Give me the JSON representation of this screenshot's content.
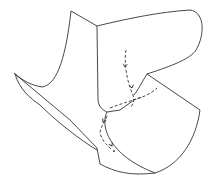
{
  "figure": {
    "type": "line-drawing",
    "stroke_color": "#333333",
    "background": "#ffffff",
    "surface_outline": [
      "M71,11 L97,26 C130,18 160,12 190,10 C205,12 205,35 196,50 C190,60 165,68 147,74 L200,110 C196,140 180,165 155,173 C130,176 115,172 100,164 L97,148 L70,120 L15,74 L14,73 C22,80 30,85 42,87 C55,85 65,65 71,11",
      "M97,26 L98,100 C99,108 103,110 107,112",
      "M15,74 C20,90 30,98 40,105 C55,120 80,140 97,150",
      "M147,74 C142,82 138,90 134,95",
      "M107,112 L120,110 L134,100",
      "M107,112 C100,125 108,155 155,173"
    ],
    "dashed_paths": [
      "M126,50 C124,60 126,80 133,95 C135,100 133,105 130,108",
      "M133,100 C140,98 150,95 157,88",
      "M110,108 C120,104 128,102 142,97",
      "M107,116 C104,124 98,130 101,136 C104,143 107,145 112,150"
    ],
    "arrowheads": [
      {
        "x": 125,
        "y": 67,
        "angle": 95
      },
      {
        "x": 132,
        "y": 88,
        "angle": 80
      },
      {
        "x": 112,
        "y": 146,
        "angle": 60
      },
      {
        "x": 103,
        "y": 122,
        "angle": 120
      }
    ],
    "endpoint_dot": {
      "x": 114,
      "y": 151
    }
  }
}
